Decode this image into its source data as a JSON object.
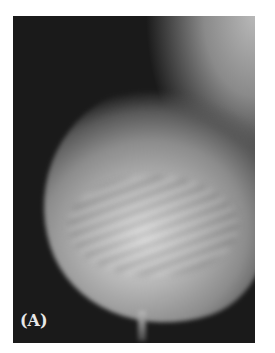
{
  "figure": {
    "panel_label": "(A)"
  }
}
